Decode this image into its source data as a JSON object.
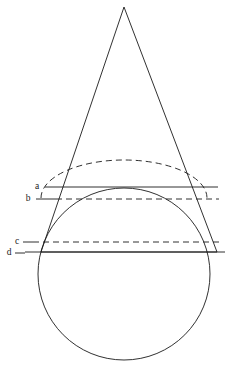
{
  "figure": {
    "background_color": "#ffffff",
    "stroke_color": "#1a1a1a",
    "canvas": {
      "width": 251,
      "height": 373
    },
    "shapes": {
      "circle": {
        "name": "sphere-outline",
        "center_x": 124,
        "center_y": 274,
        "radius": 86,
        "style": "solid"
      },
      "cone": {
        "name": "cone-triangle",
        "apex_x": 124,
        "apex_y": 7,
        "left_base_x": 41,
        "left_base_y": 252,
        "right_base_x": 217,
        "right_base_y": 252,
        "style": "solid"
      },
      "upper_ellipse_arc": {
        "name": "upper-section-back-arc",
        "center_x": 124,
        "center_y": 198,
        "rx": 83,
        "ry": 38,
        "style": "dashed"
      },
      "lower_ellipse_arc": {
        "name": "lower-section-back-arc",
        "center_x": 124,
        "center_y": 252,
        "rx": 93,
        "ry": 11,
        "style": "dashed"
      }
    },
    "levels": [
      {
        "id": "a",
        "label": "a",
        "line_style": "solid",
        "y": 187,
        "x_start": 62,
        "x_end": 218,
        "label_x": 37,
        "label_y": 187,
        "leader_x_start": 45,
        "leader_x_end": 62
      },
      {
        "id": "b",
        "label": "b",
        "line_style": "dashed",
        "y": 199,
        "x_start": 56,
        "x_end": 219,
        "label_x": 28,
        "label_y": 199,
        "leader_x_start": 36,
        "leader_x_end": 56
      },
      {
        "id": "c",
        "label": "c",
        "line_style": "dashed",
        "y": 242,
        "x_start": 33,
        "x_end": 223,
        "label_x": 17,
        "label_y": 242,
        "leader_x_start": 23,
        "leader_x_end": 33
      },
      {
        "id": "d",
        "label": "d",
        "line_style": "solid",
        "y": 252,
        "x_start": 25,
        "x_end": 225,
        "label_x": 9,
        "label_y": 253,
        "leader_x_start": 15,
        "leader_x_end": 25
      }
    ]
  }
}
